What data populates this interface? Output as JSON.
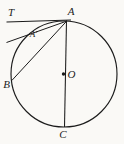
{
  "figure": {
    "labels": {
      "T": "T",
      "A": "A",
      "A_prime": "A′",
      "B": "B",
      "O": "O",
      "C": "C"
    },
    "colors": {
      "line": "#1c1c1c",
      "label": "#1c1c1c",
      "background": "#faf9f6"
    }
  }
}
